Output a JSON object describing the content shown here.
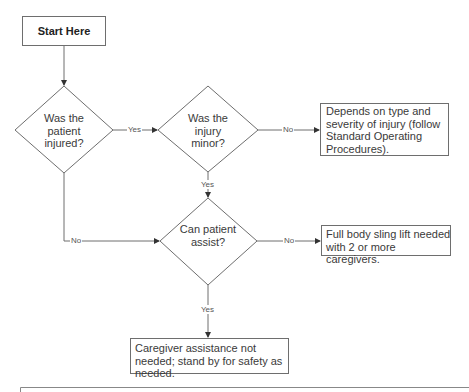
{
  "flowchart": {
    "nodes": {
      "start": {
        "label": "Start Here"
      },
      "q_injured": {
        "label": "Was the patient injured?"
      },
      "q_minor": {
        "label": "Was the injury minor?"
      },
      "q_assist": {
        "label": "Can patient assist?"
      },
      "r_sop": {
        "label": "Depends on type and severity of injury (follow Standard Operating Procedures)."
      },
      "r_sling": {
        "label": "Full body sling lift needed with 2 or more caregivers."
      },
      "r_standby": {
        "label": "Caregiver assistance not needed; stand by for safety as needed."
      }
    },
    "edges": {
      "injured_yes": {
        "label": "Yes"
      },
      "minor_no": {
        "label": "No"
      },
      "minor_yes": {
        "label": "Yes"
      },
      "injured_no": {
        "label": "No"
      },
      "assist_no": {
        "label": "No"
      },
      "assist_yes": {
        "label": "Yes"
      }
    },
    "colors": {
      "stroke": "#6e6e6e",
      "text": "#3a3a3a",
      "background": "#ffffff"
    }
  }
}
